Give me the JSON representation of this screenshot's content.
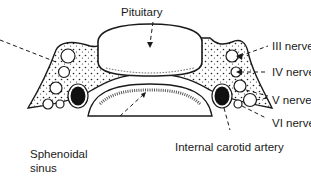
{
  "diagram": {
    "type": "anatomical-cross-section",
    "colors": {
      "ink": "#1a1a1a",
      "background": "#ffffff",
      "fill": "#ffffff",
      "dark": "#111111"
    },
    "labels": {
      "pituitary": "Pituitary",
      "nerve3": "III nerve",
      "nerve4": "IV nerve",
      "nerve5": "V nerve",
      "nerve6": "VI nerve",
      "carotid": "Internal carotid artery",
      "sinus_line1": "Sphenoidal",
      "sinus_line2": "sinus"
    }
  }
}
